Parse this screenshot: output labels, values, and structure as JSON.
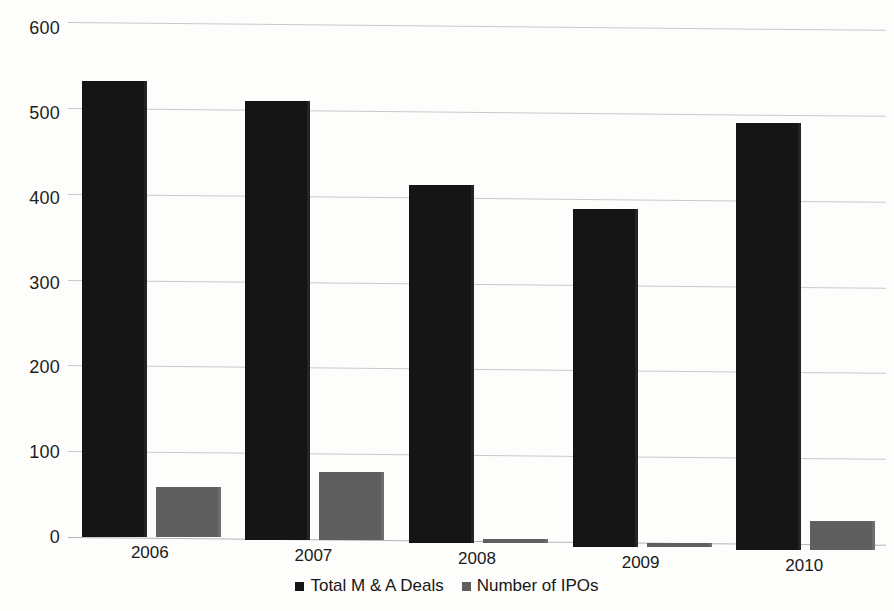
{
  "chart_data": {
    "type": "bar",
    "title": "",
    "subtitle": "",
    "xlabel": "",
    "ylabel": "",
    "categories": [
      "2006",
      "2007",
      "2008",
      "2009",
      "2010"
    ],
    "series": [
      {
        "name": "Total M & A Deals",
        "color": "#151515",
        "values": [
          531,
          512,
          417,
          393,
          497
        ]
      },
      {
        "name": "Number of IPOs",
        "color": "#5f5f5f",
        "values": [
          58,
          80,
          5,
          4,
          34
        ]
      }
    ],
    "ylim": [
      0,
      600
    ],
    "yticks": [
      0,
      100,
      200,
      300,
      400,
      500,
      600
    ],
    "ytick_labels": [
      "0",
      "100",
      "200",
      "300",
      "400",
      "500",
      "600"
    ],
    "grid": true,
    "grid_axis": "y",
    "legend_position": "bottom",
    "legend_entries": [
      "Total M & A Deals",
      "Number of IPOs"
    ]
  },
  "colors": {
    "background": "#fdfdfc",
    "gridline": "#c9c9c9",
    "axis": "#b3b3b3",
    "text": "#1a1a1a",
    "series_total_deals": "#151515",
    "series_ipos": "#5f5f5f"
  }
}
